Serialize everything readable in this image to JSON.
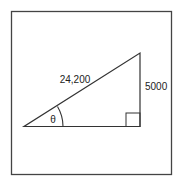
{
  "diagram": {
    "type": "right-triangle",
    "hypotenuse_label": "24,200",
    "opposite_label": "5000",
    "angle_label": "θ",
    "right_angle_marker": true,
    "colors": {
      "stroke": "#333333",
      "background": "#ffffff"
    }
  }
}
